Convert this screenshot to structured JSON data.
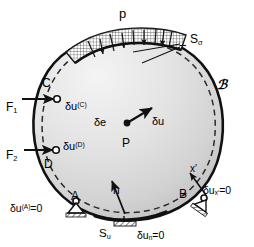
{
  "figure": {
    "name": "virtual-work-deformable-body-diagram",
    "body_symbol": "ℬ",
    "colors": {
      "outline": "#111111",
      "body_fill_light": "#f2f2f2",
      "body_fill_dark": "#c9c9c9",
      "dashed_deformed": "#2a2a2a",
      "hatch": "#2b2b2b",
      "background": "#ffffff"
    }
  },
  "labels": {
    "pressure": "p",
    "traction_surface": {
      "base": "S",
      "sub": "σ"
    },
    "displacement_surface": {
      "base": "S",
      "sub": "u"
    },
    "body": "ℬ",
    "point_C": "C",
    "point_D": "D",
    "point_A": "A",
    "point_B": "B",
    "point_P": "P",
    "force_1": {
      "base": "F",
      "sub": "1"
    },
    "force_2": {
      "base": "F",
      "sub": "2"
    },
    "virtual_disp_C": {
      "base": "δu",
      "sup": "(C)"
    },
    "virtual_disp_D": {
      "base": "δu",
      "sup": "(D)"
    },
    "virtual_disp_A": {
      "base": "δu",
      "sup": "(A)",
      "tail": "=0"
    },
    "virtual_disp_B": {
      "base": "δu",
      "sub": "x′",
      "tail": "=0"
    },
    "virtual_disp_n": {
      "base": "δu",
      "sub": "n",
      "tail": "=0"
    },
    "virtual_strain": "δe",
    "virtual_disp_P": "δu",
    "normal_vector": "n",
    "local_axis": "x′"
  },
  "annotations": [
    {
      "name": "pressure-load-p",
      "text": "p"
    },
    {
      "name": "traction-boundary-sigma",
      "text": "Sσ"
    },
    {
      "name": "body-label-script-B",
      "text": "ℬ"
    },
    {
      "name": "concentrated-force-F1",
      "text": "F1"
    },
    {
      "name": "concentrated-force-F2",
      "text": "F2"
    },
    {
      "name": "virtual-displacement-C",
      "text": "δu(C)"
    },
    {
      "name": "virtual-displacement-D",
      "text": "δu(D)"
    },
    {
      "name": "constraint-A",
      "text": "δu(A)=0"
    },
    {
      "name": "constraint-B",
      "text": "δux′=0"
    },
    {
      "name": "constraint-normal",
      "text": "δun=0"
    },
    {
      "name": "displacement-boundary-Su",
      "text": "Su"
    },
    {
      "name": "virtual-strain-de",
      "text": "δe"
    },
    {
      "name": "material-point-P",
      "text": "P"
    },
    {
      "name": "virtual-displacement-P",
      "text": "δu"
    },
    {
      "name": "outward-normal-n",
      "text": "n"
    },
    {
      "name": "local-axis-xprime",
      "text": "x′"
    }
  ]
}
